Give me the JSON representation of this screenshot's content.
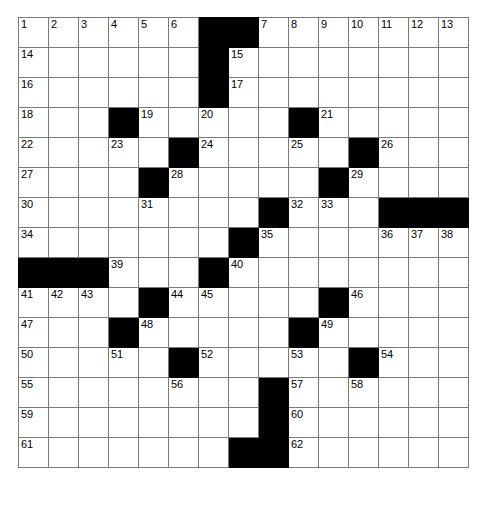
{
  "puzzle": {
    "title": "Crossword Puzzle Grid",
    "size": {
      "rows": 15,
      "cols": 15
    },
    "colors": {
      "block": "#000000",
      "open": "#ffffff",
      "gridline": "#7a7a7a",
      "number": "#000000"
    },
    "legend": {
      "block_symbol": "#",
      "open_symbol": "."
    },
    "grid": [
      "......##.......",
      "......#........",
      "......#........",
      "...#.....#.....",
      ".....#.....#...",
      "....#.....#....",
      "........#...###",
      ".......#.......",
      "###...#........",
      "....#.....#....",
      "...#.....#.....",
      ".....#.....#...",
      "........#......",
      "........#......",
      ".......##......"
    ],
    "numbers": [
      {
        "row": 0,
        "col": 0,
        "n": "1"
      },
      {
        "row": 0,
        "col": 1,
        "n": "2"
      },
      {
        "row": 0,
        "col": 2,
        "n": "3"
      },
      {
        "row": 0,
        "col": 3,
        "n": "4"
      },
      {
        "row": 0,
        "col": 4,
        "n": "5"
      },
      {
        "row": 0,
        "col": 5,
        "n": "6"
      },
      {
        "row": 0,
        "col": 8,
        "n": "7"
      },
      {
        "row": 0,
        "col": 9,
        "n": "8"
      },
      {
        "row": 0,
        "col": 10,
        "n": "9"
      },
      {
        "row": 0,
        "col": 11,
        "n": "10"
      },
      {
        "row": 0,
        "col": 12,
        "n": "11"
      },
      {
        "row": 0,
        "col": 13,
        "n": "12"
      },
      {
        "row": 0,
        "col": 14,
        "n": "13"
      },
      {
        "row": 1,
        "col": 0,
        "n": "14"
      },
      {
        "row": 1,
        "col": 7,
        "n": "15"
      },
      {
        "row": 2,
        "col": 0,
        "n": "16"
      },
      {
        "row": 2,
        "col": 7,
        "n": "17"
      },
      {
        "row": 3,
        "col": 0,
        "n": "18"
      },
      {
        "row": 3,
        "col": 4,
        "n": "19"
      },
      {
        "row": 3,
        "col": 6,
        "n": "20"
      },
      {
        "row": 3,
        "col": 10,
        "n": "21"
      },
      {
        "row": 4,
        "col": 0,
        "n": "22"
      },
      {
        "row": 4,
        "col": 3,
        "n": "23"
      },
      {
        "row": 4,
        "col": 6,
        "n": "24"
      },
      {
        "row": 4,
        "col": 9,
        "n": "25"
      },
      {
        "row": 4,
        "col": 12,
        "n": "26"
      },
      {
        "row": 5,
        "col": 0,
        "n": "27"
      },
      {
        "row": 5,
        "col": 5,
        "n": "28"
      },
      {
        "row": 5,
        "col": 11,
        "n": "29"
      },
      {
        "row": 6,
        "col": 0,
        "n": "30"
      },
      {
        "row": 6,
        "col": 4,
        "n": "31"
      },
      {
        "row": 6,
        "col": 9,
        "n": "32"
      },
      {
        "row": 6,
        "col": 10,
        "n": "33"
      },
      {
        "row": 7,
        "col": 0,
        "n": "34"
      },
      {
        "row": 7,
        "col": 8,
        "n": "35"
      },
      {
        "row": 7,
        "col": 12,
        "n": "36"
      },
      {
        "row": 7,
        "col": 13,
        "n": "37"
      },
      {
        "row": 7,
        "col": 14,
        "n": "38"
      },
      {
        "row": 8,
        "col": 3,
        "n": "39"
      },
      {
        "row": 8,
        "col": 7,
        "n": "40"
      },
      {
        "row": 9,
        "col": 0,
        "n": "41"
      },
      {
        "row": 9,
        "col": 1,
        "n": "42"
      },
      {
        "row": 9,
        "col": 2,
        "n": "43"
      },
      {
        "row": 9,
        "col": 5,
        "n": "44"
      },
      {
        "row": 9,
        "col": 6,
        "n": "45"
      },
      {
        "row": 9,
        "col": 11,
        "n": "46"
      },
      {
        "row": 10,
        "col": 0,
        "n": "47"
      },
      {
        "row": 10,
        "col": 4,
        "n": "48"
      },
      {
        "row": 10,
        "col": 10,
        "n": "49"
      },
      {
        "row": 11,
        "col": 0,
        "n": "50"
      },
      {
        "row": 11,
        "col": 3,
        "n": "51"
      },
      {
        "row": 11,
        "col": 6,
        "n": "52"
      },
      {
        "row": 11,
        "col": 9,
        "n": "53"
      },
      {
        "row": 11,
        "col": 12,
        "n": "54"
      },
      {
        "row": 12,
        "col": 0,
        "n": "55"
      },
      {
        "row": 12,
        "col": 5,
        "n": "56"
      },
      {
        "row": 12,
        "col": 9,
        "n": "57"
      },
      {
        "row": 12,
        "col": 11,
        "n": "58"
      },
      {
        "row": 13,
        "col": 0,
        "n": "59"
      },
      {
        "row": 13,
        "col": 9,
        "n": "60"
      },
      {
        "row": 14,
        "col": 0,
        "n": "61"
      },
      {
        "row": 14,
        "col": 9,
        "n": "62"
      }
    ],
    "letters": []
  }
}
